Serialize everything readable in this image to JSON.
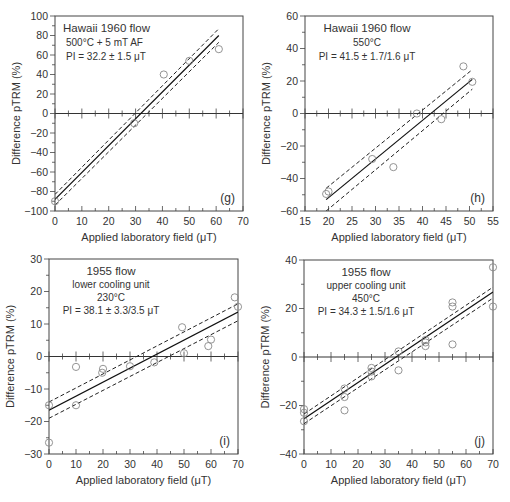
{
  "figure": {
    "y_axis_label": "Difference pTRM (%)",
    "x_axis_label": "Applied laboratory field (μT)"
  },
  "chart_data": [
    {
      "panel": "(g)",
      "type": "scatter",
      "annotation": [
        "Hawaii 1960 flow",
        "500°C + 5 mT AF",
        "PI = 32.2 ± 1.5 μT"
      ],
      "annotation_align": "left",
      "xlabel": "Applied laboratory field (μT)",
      "ylabel": "Difference pTRM (%)",
      "xlim": [
        0,
        70
      ],
      "ylim": [
        -100,
        100
      ],
      "xticks": [
        0,
        10,
        20,
        30,
        40,
        50,
        60,
        70
      ],
      "yticks": [
        -100,
        -80,
        -60,
        -40,
        -20,
        0,
        20,
        40,
        60,
        80,
        100
      ],
      "xminor": 5,
      "yminor": 10,
      "frame": {
        "left": 55,
        "top": 16,
        "right": 243,
        "bottom": 211
      },
      "points": [
        [
          0,
          -90
        ],
        [
          29.5,
          -10
        ],
        [
          40.5,
          40
        ],
        [
          50,
          54
        ],
        [
          61,
          66
        ]
      ],
      "fit": {
        "x0": 0,
        "y0": -88,
        "x1": 61,
        "y1": 80
      },
      "upper": {
        "x0": 0,
        "y0": -83,
        "x1": 61,
        "y1": 87
      },
      "lower": {
        "x0": 0,
        "y0": -94,
        "x1": 61,
        "y1": 73
      },
      "grid": false,
      "legend": "none"
    },
    {
      "panel": "(h)",
      "type": "scatter",
      "annotation": [
        "Hawaii 1960 flow",
        "550°C",
        "PI = 41.5 ± 1.7/1.6 μT"
      ],
      "annotation_align": "center",
      "xlabel": "Applied laboratory field (μT)",
      "ylabel": "Difference pTRM (%)",
      "xlim": [
        15,
        55
      ],
      "ylim": [
        -60,
        60
      ],
      "xticks": [
        15,
        20,
        25,
        30,
        35,
        40,
        45,
        50,
        55
      ],
      "yticks": [
        -60,
        -40,
        -20,
        0,
        20,
        40,
        60
      ],
      "xminor": 2.5,
      "yminor": 10,
      "frame": {
        "left": 305,
        "top": 16,
        "right": 493,
        "bottom": 211
      },
      "points": [
        [
          19.5,
          -49.5
        ],
        [
          20,
          -48
        ],
        [
          29.3,
          -28
        ],
        [
          33.8,
          -33
        ],
        [
          38.8,
          0
        ],
        [
          44,
          -3.5
        ],
        [
          48.7,
          29
        ],
        [
          50.6,
          19.5
        ]
      ],
      "fit": {
        "x0": 19.5,
        "y0": -53,
        "x1": 50.6,
        "y1": 21
      },
      "upper": {
        "x0": 19.5,
        "y0": -46,
        "x1": 50.6,
        "y1": 27
      },
      "lower": {
        "x0": 19.5,
        "y0": -60,
        "x1": 50.6,
        "y1": 15
      },
      "grid": false,
      "legend": "none"
    },
    {
      "panel": "(i)",
      "type": "scatter",
      "annotation": [
        "1955 flow",
        "lower cooling unit",
        "230°C",
        "PI = 38.1 ± 3.3/3.5 μT"
      ],
      "annotation_align": "center",
      "xlabel": "Applied laboratory field (μT)",
      "ylabel": "Difference pTRM (%)",
      "xlim": [
        0,
        70
      ],
      "ylim": [
        -30,
        30
      ],
      "xticks": [
        0,
        10,
        20,
        30,
        40,
        50,
        60,
        70
      ],
      "yticks": [
        -30,
        -20,
        -10,
        0,
        10,
        20,
        30
      ],
      "xminor": 5,
      "yminor": 5,
      "frame": {
        "left": 49,
        "top": 259,
        "right": 238,
        "bottom": 454
      },
      "points": [
        [
          0,
          -15
        ],
        [
          0,
          -26.5
        ],
        [
          10,
          -3.2
        ],
        [
          10,
          -15
        ],
        [
          20,
          -3.8
        ],
        [
          19.7,
          -5
        ],
        [
          30,
          -3
        ],
        [
          39,
          -1.8
        ],
        [
          49.3,
          9
        ],
        [
          50,
          1
        ],
        [
          59,
          3.2
        ],
        [
          60,
          5.2
        ],
        [
          68.8,
          18.2
        ],
        [
          70,
          15.3
        ]
      ],
      "fit": {
        "x0": 0,
        "y0": -16.5,
        "x1": 70,
        "y1": 13.7
      },
      "upper": {
        "x0": 0,
        "y0": -14,
        "x1": 70,
        "y1": 16.2
      },
      "lower": {
        "x0": 0,
        "y0": -19,
        "x1": 70,
        "y1": 11
      },
      "grid": false,
      "legend": "none"
    },
    {
      "panel": "(j)",
      "type": "scatter",
      "annotation": [
        "1955 flow",
        "upper cooling unit",
        "450°C",
        "PI = 34.3 ± 1.5/1.6 μT"
      ],
      "annotation_align": "center",
      "xlabel": "Applied laboratory field (μT)",
      "ylabel": "Difference pTRM (%)",
      "xlim": [
        0,
        70
      ],
      "ylim": [
        -40,
        40
      ],
      "xticks": [
        0,
        10,
        20,
        30,
        40,
        50,
        60,
        70
      ],
      "yticks": [
        -40,
        -20,
        0,
        20,
        40
      ],
      "xminor": 5,
      "yminor": 10,
      "frame": {
        "left": 304,
        "top": 260,
        "right": 493,
        "bottom": 454
      },
      "points": [
        [
          0,
          -21.5
        ],
        [
          0,
          -23
        ],
        [
          0,
          -26.5
        ],
        [
          15,
          -13
        ],
        [
          15,
          -16.5
        ],
        [
          15,
          -22
        ],
        [
          25,
          -4.5
        ],
        [
          25,
          -6
        ],
        [
          25,
          -8
        ],
        [
          35,
          2.3
        ],
        [
          35,
          -5.5
        ],
        [
          45,
          7
        ],
        [
          45,
          6
        ],
        [
          45,
          4.5
        ],
        [
          55,
          22.5
        ],
        [
          55,
          20.8
        ],
        [
          55,
          5.2
        ],
        [
          70,
          37
        ],
        [
          70,
          20.8
        ]
      ],
      "fit": {
        "x0": 0,
        "y0": -25.5,
        "x1": 70,
        "y1": 26.8
      },
      "upper": {
        "x0": 0,
        "y0": -23.5,
        "x1": 70,
        "y1": 28.8
      },
      "lower": {
        "x0": 0,
        "y0": -27.5,
        "x1": 70,
        "y1": 24.3
      },
      "grid": false,
      "legend": "none"
    }
  ]
}
